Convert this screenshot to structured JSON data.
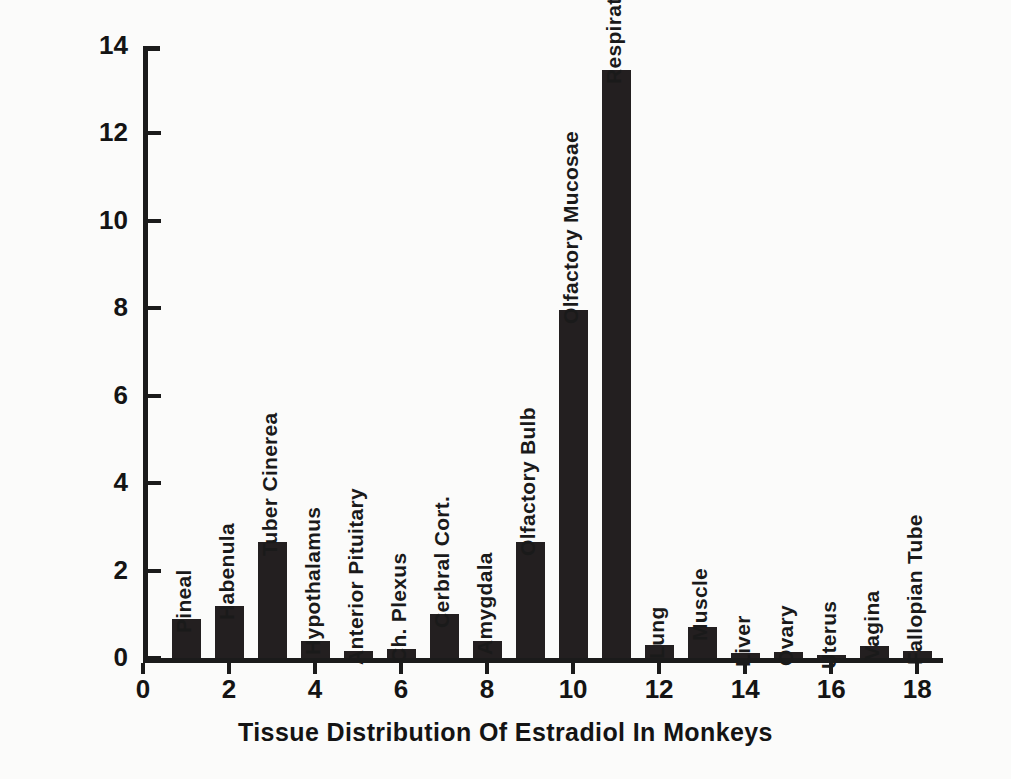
{
  "chart_data": {
    "type": "bar",
    "title": "",
    "xlabel": "Tissue  Distribution  Of  Estradiol  In  Monkeys",
    "ylabel": "(Nasal/Intravenous) Ratioactivity Ratio",
    "xlim": [
      0,
      18.6
    ],
    "ylim": [
      0,
      14
    ],
    "grid": false,
    "legend": null,
    "yticks": [
      0,
      2,
      4,
      6,
      8,
      10,
      12,
      14
    ],
    "yticklabels": [
      "0",
      "2",
      "4",
      "6",
      "8",
      "10",
      "12",
      "14"
    ],
    "xticks": [
      0,
      2,
      4,
      6,
      8,
      10,
      12,
      14,
      16,
      18
    ],
    "xticklabels": [
      "0",
      "2",
      "4",
      "6",
      "8",
      "10",
      "12",
      "14",
      "16",
      "18"
    ],
    "bar_color": "#231f20",
    "x": [
      1,
      2,
      3,
      4,
      5,
      6,
      7,
      8,
      9,
      10,
      11,
      12,
      13,
      14,
      15,
      16,
      17,
      18
    ],
    "categories": [
      "Pineal",
      "Habenula",
      "Tuber Cinerea",
      "Hypothalamus",
      "Anterior Pituitary",
      "Ch. Plexus",
      "Cerbral Cort.",
      "Amygdala",
      "Olfactory Bulb",
      "Olfactory Mucosae",
      "Respiratory Mucosae",
      "Lung",
      "Muscle",
      "Liver",
      "Ovary",
      "Uterus",
      "Vagina",
      "Fallopian Tube"
    ],
    "values": [
      0.9,
      1.2,
      2.65,
      0.4,
      0.17,
      0.2,
      1.0,
      0.4,
      2.65,
      7.95,
      13.45,
      0.3,
      0.72,
      0.12,
      0.13,
      0.07,
      0.27,
      0.17
    ]
  }
}
